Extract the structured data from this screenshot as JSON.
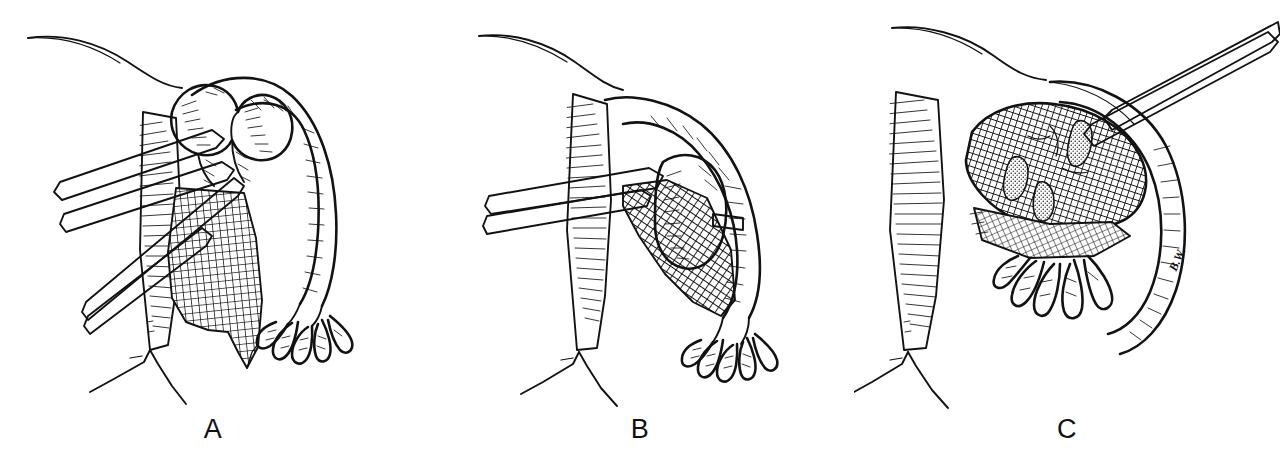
{
  "figure": {
    "domain": "medical-surgical-line-illustration",
    "background_color": "#ffffff",
    "ink_color": "#121212",
    "panel_count": 3,
    "technique": "pen-and-ink stipple and cross-hatch line drawing",
    "width_px": 1280,
    "height_px": 457
  },
  "panels": [
    {
      "id": "A",
      "label": "A",
      "caption_letter": "A",
      "description": "Fallopian tube with swollen ampullary segment grasped by three surgical clamps entering from lower left; mesosalpinx shown as cross-hatched fan; fimbriae at lower right; uterine vessel bifurcation below.",
      "instrument_count": 3,
      "instrument_name": "surgical-clamp",
      "structures": [
        "abdominal-wall-contour",
        "fallopian-tube",
        "ampullary-swelling",
        "mesosalpinx-mesh",
        "fimbriae",
        "uterine-vessel-bifurcation"
      ]
    },
    {
      "id": "B",
      "label": "B",
      "caption_letter": "B",
      "description": "Single clamp retracts the mesosalpinx; tubal mass now displaced laterally with dense cross-hatched mesosalpinx beneath; ligature across the tube at right.",
      "instrument_count": 1,
      "instrument_name": "surgical-clamp",
      "structures": [
        "abdominal-wall-contour",
        "fallopian-tube",
        "tubal-mass",
        "mesosalpinx-mesh",
        "ligature-band",
        "fimbriae",
        "uterine-vessel-bifurcation"
      ]
    },
    {
      "id": "C",
      "label": "C",
      "caption_letter": "C",
      "description": "Excised specimen: ovoid cross-hatched mass with stippled teardrop clot regions, held by a single clamp entering from upper right; fimbriae below; artist signature along the right border.",
      "instrument_count": 1,
      "instrument_name": "surgical-clamp",
      "structures": [
        "abdominal-wall-contour",
        "specimen-mass",
        "clot-stipple-regions",
        "mesosalpinx-mesh",
        "fimbriae",
        "uterine-vessel-bifurcation"
      ]
    }
  ],
  "signature": {
    "text": "B.W.",
    "location": "panel C right border",
    "orientation": "rotated along tube margin"
  }
}
